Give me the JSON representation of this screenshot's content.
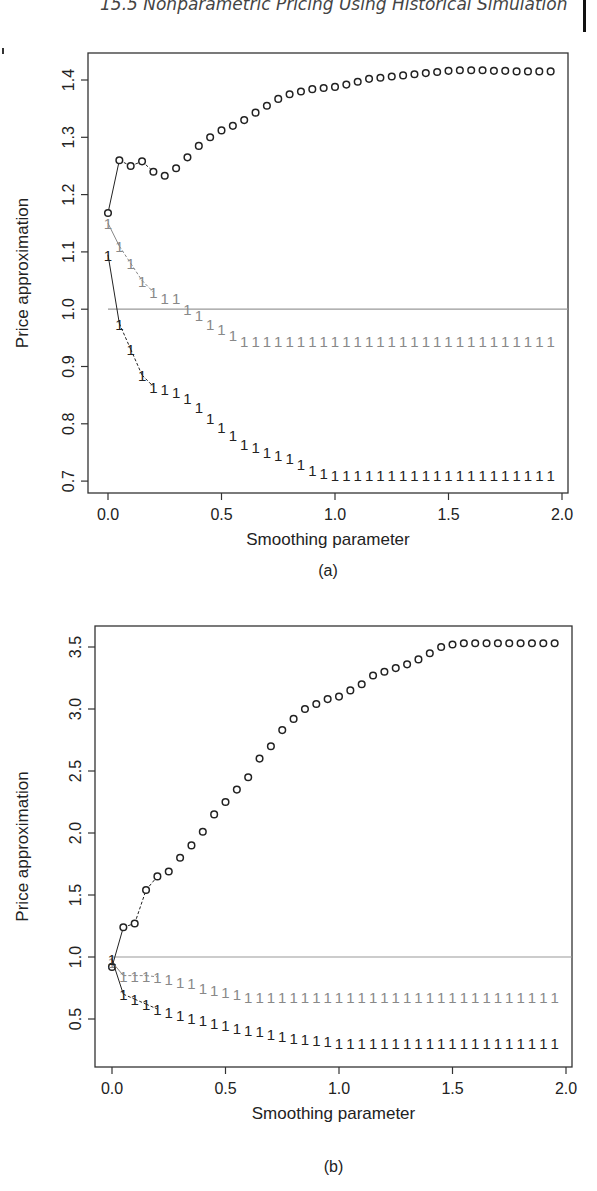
{
  "header": {
    "running_title": "15.5  Nonparametric Pricing Using Historical Simulation"
  },
  "colors": {
    "black": "#222222",
    "grey": "#888888",
    "reference_line": "#999999"
  },
  "chart_data": [
    {
      "type": "scatter",
      "caption": "(a)",
      "xlabel": "Smoothing parameter",
      "ylabel": "Price approximation",
      "xlim": [
        0,
        2.0
      ],
      "ylim": [
        0.7,
        1.4
      ],
      "xticks": [
        "0.0",
        "0.5",
        "1.0",
        "1.5",
        "2.0"
      ],
      "yticks": [
        "0.7",
        "0.8",
        "0.9",
        "1.0",
        "1.1",
        "1.2",
        "1.3",
        "1.4"
      ],
      "reference_line": 1.0,
      "x": [
        0,
        0.05,
        0.1,
        0.15,
        0.2,
        0.25,
        0.3,
        0.35,
        0.4,
        0.45,
        0.5,
        0.55,
        0.6,
        0.65,
        0.7,
        0.75,
        0.8,
        0.85,
        0.9,
        0.95,
        1.0,
        1.05,
        1.1,
        1.15,
        1.2,
        1.25,
        1.3,
        1.35,
        1.4,
        1.45,
        1.5,
        1.55,
        1.6,
        1.65,
        1.7,
        1.75,
        1.8,
        1.85,
        1.9,
        1.95
      ],
      "series": [
        {
          "name": "circles",
          "marker": "o",
          "color": "#222222",
          "values": [
            1.168,
            1.26,
            1.25,
            1.258,
            1.24,
            1.233,
            1.246,
            1.265,
            1.285,
            1.3,
            1.312,
            1.32,
            1.33,
            1.343,
            1.355,
            1.367,
            1.375,
            1.38,
            1.384,
            1.386,
            1.388,
            1.392,
            1.397,
            1.402,
            1.404,
            1.406,
            1.408,
            1.41,
            1.412,
            1.414,
            1.416,
            1.417,
            1.417,
            1.417,
            1.416,
            1.416,
            1.415,
            1.415,
            1.415,
            1.415
          ]
        },
        {
          "name": "upper-ones",
          "marker": "1",
          "color": "#888888",
          "values": [
            1.15,
            1.11,
            1.08,
            1.05,
            1.03,
            1.02,
            1.02,
            1.0,
            0.99,
            0.975,
            0.965,
            0.955,
            0.945,
            0.945,
            0.945,
            0.945,
            0.945,
            0.945,
            0.945,
            0.945,
            0.945,
            0.945,
            0.945,
            0.945,
            0.945,
            0.945,
            0.945,
            0.945,
            0.945,
            0.945,
            0.945,
            0.945,
            0.945,
            0.945,
            0.945,
            0.945,
            0.945,
            0.945,
            0.945,
            0.945
          ]
        },
        {
          "name": "lower-ones",
          "marker": "1",
          "color": "#222222",
          "values": [
            1.095,
            0.975,
            0.93,
            0.885,
            0.865,
            0.86,
            0.855,
            0.845,
            0.83,
            0.81,
            0.795,
            0.78,
            0.765,
            0.76,
            0.75,
            0.745,
            0.74,
            0.73,
            0.72,
            0.715,
            0.71,
            0.71,
            0.71,
            0.71,
            0.71,
            0.71,
            0.71,
            0.71,
            0.71,
            0.71,
            0.71,
            0.71,
            0.71,
            0.71,
            0.71,
            0.71,
            0.71,
            0.71,
            0.71,
            0.71
          ]
        }
      ]
    },
    {
      "type": "scatter",
      "caption": "(b)",
      "xlabel": "Smoothing parameter",
      "ylabel": "Price approximation",
      "xlim": [
        0,
        2.0
      ],
      "ylim": [
        0.25,
        3.6
      ],
      "xticks": [
        "0.0",
        "0.5",
        "1.0",
        "1.5",
        "2.0"
      ],
      "yticks": [
        "0.5",
        "1.0",
        "1.5",
        "2.0",
        "2.5",
        "3.0",
        "3.5"
      ],
      "reference_line": 1.0,
      "x": [
        0,
        0.05,
        0.1,
        0.15,
        0.2,
        0.25,
        0.3,
        0.35,
        0.4,
        0.45,
        0.5,
        0.55,
        0.6,
        0.65,
        0.7,
        0.75,
        0.8,
        0.85,
        0.9,
        0.95,
        1.0,
        1.05,
        1.1,
        1.15,
        1.2,
        1.25,
        1.3,
        1.35,
        1.4,
        1.45,
        1.5,
        1.55,
        1.6,
        1.65,
        1.7,
        1.75,
        1.8,
        1.85,
        1.9,
        1.95
      ],
      "series": [
        {
          "name": "circles",
          "marker": "o",
          "color": "#222222",
          "values": [
            0.92,
            1.24,
            1.27,
            1.54,
            1.65,
            1.69,
            1.8,
            1.9,
            2.01,
            2.15,
            2.25,
            2.35,
            2.45,
            2.6,
            2.7,
            2.83,
            2.92,
            3.0,
            3.04,
            3.08,
            3.1,
            3.15,
            3.2,
            3.27,
            3.3,
            3.33,
            3.36,
            3.4,
            3.45,
            3.5,
            3.52,
            3.53,
            3.53,
            3.53,
            3.53,
            3.53,
            3.53,
            3.53,
            3.53,
            3.53
          ]
        },
        {
          "name": "upper-ones",
          "marker": "1",
          "color": "#888888",
          "values": [
            0.96,
            0.85,
            0.85,
            0.85,
            0.84,
            0.82,
            0.8,
            0.79,
            0.75,
            0.73,
            0.72,
            0.7,
            0.68,
            0.68,
            0.68,
            0.68,
            0.68,
            0.68,
            0.68,
            0.68,
            0.68,
            0.68,
            0.68,
            0.68,
            0.68,
            0.68,
            0.68,
            0.68,
            0.68,
            0.68,
            0.68,
            0.68,
            0.68,
            0.68,
            0.68,
            0.68,
            0.68,
            0.68,
            0.68,
            0.68
          ]
        },
        {
          "name": "lower-ones",
          "marker": "1",
          "color": "#222222",
          "values": [
            0.98,
            0.7,
            0.66,
            0.62,
            0.58,
            0.56,
            0.53,
            0.51,
            0.49,
            0.47,
            0.45,
            0.43,
            0.41,
            0.4,
            0.38,
            0.36,
            0.35,
            0.34,
            0.33,
            0.32,
            0.31,
            0.31,
            0.31,
            0.31,
            0.31,
            0.31,
            0.31,
            0.31,
            0.31,
            0.31,
            0.31,
            0.31,
            0.31,
            0.31,
            0.31,
            0.31,
            0.31,
            0.31,
            0.31,
            0.31
          ]
        }
      ]
    }
  ]
}
